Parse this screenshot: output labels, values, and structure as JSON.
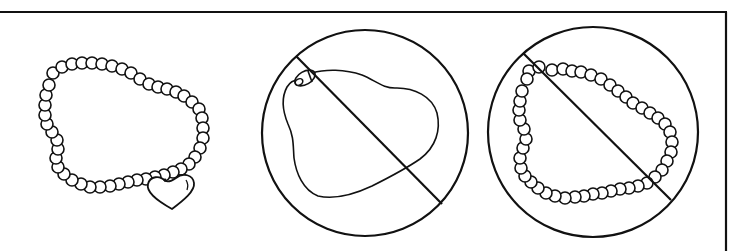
{
  "figure": {
    "stroke_color": "#111111",
    "background_color": "#ffffff",
    "frame": {
      "top_border": {
        "x1": 0,
        "x2": 727,
        "y": 12
      },
      "right_border": {
        "x": 726,
        "y1": 12,
        "y2": 251
      }
    },
    "panels": [
      {
        "id": "allowed-bead-bracelet",
        "label": "Bead bracelet with heart charm",
        "status": "allowed",
        "bead_radius": 6,
        "beads": [
          [
            53,
            73
          ],
          [
            62,
            67
          ],
          [
            72,
            64
          ],
          [
            82,
            63
          ],
          [
            92,
            63
          ],
          [
            102,
            64
          ],
          [
            112,
            66
          ],
          [
            122,
            69
          ],
          [
            131,
            73
          ],
          [
            140,
            79
          ],
          [
            149,
            84
          ],
          [
            158,
            87
          ],
          [
            167,
            89
          ],
          [
            176,
            92
          ],
          [
            184,
            96
          ],
          [
            192,
            102
          ],
          [
            199,
            109
          ],
          [
            202,
            118
          ],
          [
            203,
            128
          ],
          [
            203,
            138
          ],
          [
            200,
            148
          ],
          [
            195,
            157
          ],
          [
            189,
            164
          ],
          [
            181,
            169
          ],
          [
            173,
            172
          ],
          [
            164,
            175
          ],
          [
            155,
            177
          ],
          [
            146,
            179
          ],
          [
            137,
            180
          ],
          [
            128,
            182
          ],
          [
            119,
            184
          ],
          [
            110,
            186
          ],
          [
            100,
            187
          ],
          [
            90,
            187
          ],
          [
            81,
            184
          ],
          [
            72,
            180
          ],
          [
            64,
            174
          ],
          [
            58,
            167
          ],
          [
            56,
            158
          ],
          [
            58,
            149
          ],
          [
            57,
            140
          ],
          [
            52,
            132
          ],
          [
            47,
            124
          ],
          [
            45,
            115
          ],
          [
            45,
            105
          ],
          [
            46,
            95
          ],
          [
            49,
            85
          ]
        ],
        "charm": {
          "shape": "heart",
          "bail": [
            165,
            180
          ]
        }
      },
      {
        "id": "prohibited-cord-necklace",
        "label": "Cord necklace with clasp (prohibited)",
        "status": "prohibited",
        "circle": {
          "cx": 365,
          "cy": 133,
          "r": 103
        },
        "slash": {
          "x1": 296,
          "y1": 56,
          "x2": 442,
          "y2": 204
        }
      },
      {
        "id": "prohibited-bead-loop",
        "label": "Bead loop without charm (prohibited)",
        "status": "prohibited",
        "bead_radius": 6,
        "circle": {
          "cx": 593,
          "cy": 132,
          "r": 105
        },
        "slash": {
          "x1": 523,
          "y1": 53,
          "x2": 671,
          "y2": 200
        },
        "beads": [
          [
            529,
            71
          ],
          [
            539,
            67
          ],
          [
            552,
            70
          ],
          [
            563,
            69
          ],
          [
            572,
            71
          ],
          [
            581,
            72
          ],
          [
            591,
            75
          ],
          [
            601,
            79
          ],
          [
            610,
            85
          ],
          [
            618,
            91
          ],
          [
            626,
            97
          ],
          [
            633,
            103
          ],
          [
            642,
            108
          ],
          [
            650,
            113
          ],
          [
            658,
            118
          ],
          [
            665,
            124
          ],
          [
            670,
            132
          ],
          [
            672,
            142
          ],
          [
            671,
            152
          ],
          [
            667,
            161
          ],
          [
            662,
            170
          ],
          [
            655,
            177
          ],
          [
            647,
            183
          ],
          [
            638,
            186
          ],
          [
            629,
            188
          ],
          [
            620,
            189
          ],
          [
            611,
            191
          ],
          [
            602,
            193
          ],
          [
            593,
            194
          ],
          [
            584,
            196
          ],
          [
            575,
            197
          ],
          [
            565,
            198
          ],
          [
            555,
            196
          ],
          [
            546,
            193
          ],
          [
            538,
            188
          ],
          [
            531,
            182
          ],
          [
            525,
            176
          ],
          [
            521,
            168
          ],
          [
            520,
            158
          ],
          [
            523,
            148
          ],
          [
            526,
            139
          ],
          [
            524,
            129
          ],
          [
            520,
            120
          ],
          [
            519,
            110
          ],
          [
            520,
            101
          ],
          [
            522,
            91
          ],
          [
            527,
            79
          ]
        ]
      }
    ]
  }
}
